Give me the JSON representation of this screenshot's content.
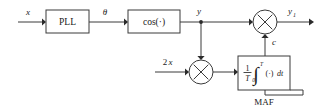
{
  "diagram": {
    "colors": {
      "wire": "#3a3a3a",
      "text": "#1a1a1a",
      "background": "#ffffff",
      "arrowhead": "#2a2a2a"
    },
    "blocks": {
      "pll": {
        "label": "PLL"
      },
      "cos": {
        "label": "cos(·)"
      },
      "maf": {
        "caption": "MAF",
        "fraction_numerator": "1",
        "fraction_denominator": "T",
        "integral_glyph": "∫",
        "integral_upper_limit": "T",
        "integral_lower_limit": "0",
        "integrand": "(·)",
        "differential": "dt"
      },
      "multiplier_top": {
        "symbol": "×"
      },
      "multiplier_bottom": {
        "symbol": "×"
      }
    },
    "signals": {
      "input_x": "x",
      "theta": "θ",
      "y": "y",
      "y_out_base": "y",
      "y_out_subscript": "1",
      "c": "c",
      "two_x_coefficient": "2",
      "two_x_variable": "x"
    }
  }
}
